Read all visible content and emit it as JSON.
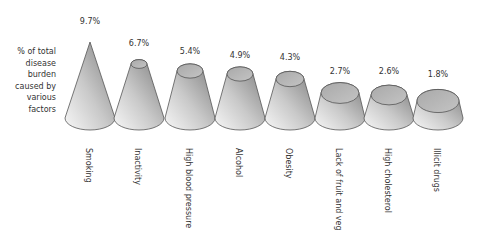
{
  "chart_data": {
    "type": "bar",
    "style": "3d-cone",
    "title": "",
    "ylabel": "% of total disease burden caused by various factors",
    "ylabel_lines": [
      "% of total",
      "disease",
      "burden",
      "caused by",
      "various",
      "factors"
    ],
    "xlabel": "",
    "categories": [
      "Smoking",
      "Inactivity",
      "High blood pressure",
      "Alcohol",
      "Obesity",
      "Lack of fruit and veg",
      "High cholesterol",
      "Illicit drugs"
    ],
    "values": [
      9.7,
      6.7,
      5.4,
      4.9,
      4.3,
      2.7,
      2.6,
      1.8
    ],
    "value_labels": [
      "9.7%",
      "6.7%",
      "5.4%",
      "4.9%",
      "4.3%",
      "2.7%",
      "2.6%",
      "1.8%"
    ],
    "grid": false,
    "legend": "none",
    "colors": {
      "fill_dark": "#8a8a8a",
      "fill_light": "#f4f4f4",
      "top": "#b5b5b5",
      "stroke": "#555555"
    }
  },
  "cones": [
    {
      "cx": 90,
      "top_y": 42,
      "top_rx": 0,
      "label_y": 17
    },
    {
      "cx": 139,
      "top_y": 64,
      "top_rx": 8,
      "label_y": 39
    },
    {
      "cx": 190,
      "top_y": 71,
      "top_rx": 13,
      "label_y": 47
    },
    {
      "cx": 240,
      "top_y": 74,
      "top_rx": 13,
      "label_y": 51
    },
    {
      "cx": 290,
      "top_y": 79,
      "top_rx": 14,
      "label_y": 53
    },
    {
      "cx": 340,
      "top_y": 93,
      "top_rx": 19,
      "label_y": 67
    },
    {
      "cx": 389,
      "top_y": 95,
      "top_rx": 18,
      "label_y": 67
    },
    {
      "cx": 438,
      "top_y": 101,
      "top_rx": 21,
      "label_y": 70
    }
  ]
}
